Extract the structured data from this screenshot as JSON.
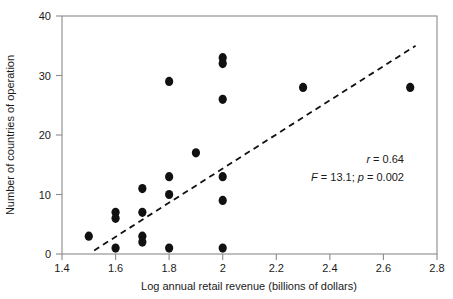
{
  "chart_data": {
    "type": "scatter",
    "title": "",
    "xlabel": "Log annual retail revenue (billions of dollars)",
    "ylabel": "Number of countries of operation",
    "xlim": [
      1.4,
      2.8
    ],
    "ylim": [
      0,
      40
    ],
    "xticks": [
      1.4,
      1.6,
      1.8,
      2.0,
      2.2,
      2.4,
      2.6,
      2.8
    ],
    "xtick_labels": [
      "1.4",
      "1.6",
      "1.8",
      "2",
      "2.2",
      "2.4",
      "2.6",
      "2.8"
    ],
    "yticks": [
      0,
      10,
      20,
      30,
      40
    ],
    "ytick_labels": [
      "0",
      "10",
      "20",
      "30",
      "40"
    ],
    "grid": false,
    "legend": false,
    "marker_color": "#111111",
    "points": [
      {
        "x": 1.5,
        "y": 3
      },
      {
        "x": 1.6,
        "y": 7
      },
      {
        "x": 1.6,
        "y": 6
      },
      {
        "x": 1.6,
        "y": 1
      },
      {
        "x": 1.7,
        "y": 11
      },
      {
        "x": 1.7,
        "y": 7
      },
      {
        "x": 1.7,
        "y": 3
      },
      {
        "x": 1.7,
        "y": 2
      },
      {
        "x": 1.8,
        "y": 29
      },
      {
        "x": 1.8,
        "y": 13
      },
      {
        "x": 1.8,
        "y": 10
      },
      {
        "x": 1.8,
        "y": 1
      },
      {
        "x": 1.9,
        "y": 17
      },
      {
        "x": 2.0,
        "y": 33
      },
      {
        "x": 2.0,
        "y": 32
      },
      {
        "x": 2.0,
        "y": 26
      },
      {
        "x": 2.0,
        "y": 13
      },
      {
        "x": 2.0,
        "y": 9
      },
      {
        "x": 2.0,
        "y": 1
      },
      {
        "x": 2.3,
        "y": 28
      },
      {
        "x": 2.7,
        "y": 28
      }
    ],
    "trendline": {
      "style": "dashed",
      "color": "#111111",
      "x_start": 1.52,
      "y_start": 0.6,
      "x_end": 2.72,
      "y_end": 35.0
    },
    "annotations": {
      "correlation_symbol": "r",
      "correlation_value": " = 0.64",
      "f_symbol": "F",
      "f_value": " = 13.1; ",
      "p_symbol": "p",
      "p_value": " = 0.002"
    }
  }
}
